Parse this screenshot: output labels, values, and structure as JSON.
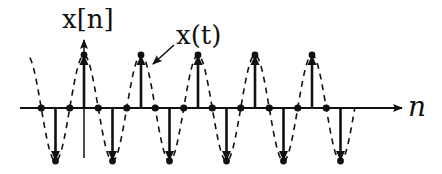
{
  "diagram": {
    "vertical_axis_label": "x[n]",
    "horizontal_axis_label": "n",
    "curve_label": "x(t)",
    "colors": {
      "ink": "#111111",
      "background": "#ffffff"
    },
    "signal": {
      "discrete_formula": "x[n] = cos(pi*n/2)",
      "period_samples": 4,
      "n_range": [
        -3,
        18
      ],
      "origin_sample": 0,
      "continuous_curve_t_range": [
        -3.8,
        19.0
      ]
    }
  }
}
